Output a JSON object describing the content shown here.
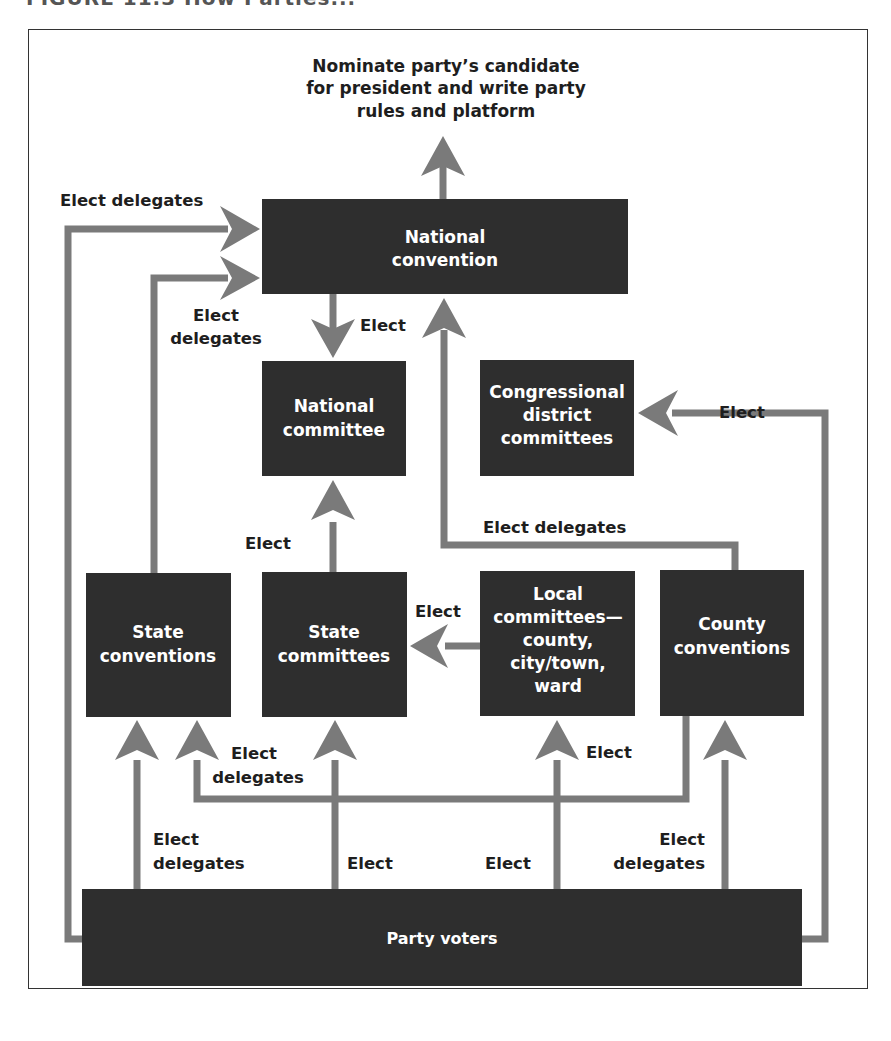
{
  "figure": {
    "title_fragment": "FIGURE 11.3  How Parties..."
  },
  "top_note": {
    "lines": [
      "Nominate party’s candidate",
      "for president and write party",
      "rules and platform"
    ]
  },
  "nodes": {
    "national_convention": {
      "lines": [
        "National",
        "convention"
      ]
    },
    "national_committee": {
      "lines": [
        "National",
        "committee"
      ]
    },
    "congressional_district_committees": {
      "lines": [
        "Congressional",
        "district",
        "committees"
      ]
    },
    "state_conventions": {
      "lines": [
        "State",
        "conventions"
      ]
    },
    "state_committees": {
      "lines": [
        "State",
        "committees"
      ]
    },
    "local_committees": {
      "lines": [
        "Local",
        "committees—",
        "county,",
        "city/town,",
        "ward"
      ]
    },
    "county_conventions": {
      "lines": [
        "County",
        "conventions"
      ]
    },
    "party_voters": {
      "lines": [
        "Party voters"
      ]
    }
  },
  "edge_labels": {
    "voters_to_national_convention": [
      "Elect delegates"
    ],
    "state_conv_to_national_convention": [
      "Elect",
      "delegates"
    ],
    "national_convention_to_national_committee": [
      "Elect"
    ],
    "voters_to_congressional": [
      "Elect"
    ],
    "county_conv_to_national_convention": [
      "Elect delegates"
    ],
    "state_committees_to_national_committee": [
      "Elect"
    ],
    "local_to_state_committees": [
      "Elect"
    ],
    "county_conv_to_state_conventions": [
      "Elect",
      "delegates"
    ],
    "voters_to_local": [
      "Elect"
    ],
    "voters_to_state_conventions": [
      "Elect",
      "delegates"
    ],
    "voters_to_state_committees": [
      "Elect"
    ],
    "voters_to_local_bottom": [
      "Elect"
    ],
    "voters_to_county_conventions": [
      "Elect",
      "delegates"
    ]
  },
  "colors": {
    "box": "#2e2e2e",
    "connector": "#7a7a7a",
    "text_dark": "#1e1e1e",
    "text_light": "#ffffff"
  }
}
